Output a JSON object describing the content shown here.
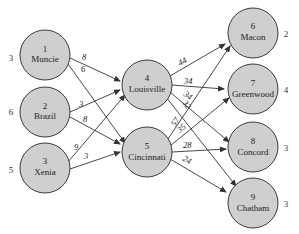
{
  "nodes": [
    {
      "id": 1,
      "name": "Muncie",
      "side": "3"
    },
    {
      "id": 2,
      "name": "Brazil",
      "side": "6"
    },
    {
      "id": 3,
      "name": "Xenia",
      "side": "5"
    },
    {
      "id": 4,
      "name": "Louisville",
      "side": ""
    },
    {
      "id": 5,
      "name": "Cincinnati",
      "side": ""
    },
    {
      "id": 6,
      "name": "Macon",
      "side": "2"
    },
    {
      "id": 7,
      "name": "Greenwood",
      "side": "4"
    },
    {
      "id": 8,
      "name": "Concord",
      "side": "3"
    },
    {
      "id": 9,
      "name": "Chatham",
      "side": "3"
    }
  ],
  "edges": [
    {
      "from": 1,
      "to": 4,
      "label": "8"
    },
    {
      "from": 1,
      "to": 5,
      "label": "6"
    },
    {
      "from": 2,
      "to": 4,
      "label": "3"
    },
    {
      "from": 2,
      "to": 5,
      "label": "8"
    },
    {
      "from": 3,
      "to": 4,
      "label": "9"
    },
    {
      "from": 3,
      "to": 5,
      "label": "3"
    },
    {
      "from": 4,
      "to": 6,
      "label": "44"
    },
    {
      "from": 4,
      "to": 7,
      "label": "34"
    },
    {
      "from": 4,
      "to": 8,
      "label": "34"
    },
    {
      "from": 4,
      "to": 9,
      "label": "32"
    },
    {
      "from": 5,
      "to": 6,
      "label": "57"
    },
    {
      "from": 5,
      "to": 7,
      "label": "35"
    },
    {
      "from": 5,
      "to": 8,
      "label": "28"
    },
    {
      "from": 5,
      "to": 9,
      "label": "24"
    }
  ]
}
